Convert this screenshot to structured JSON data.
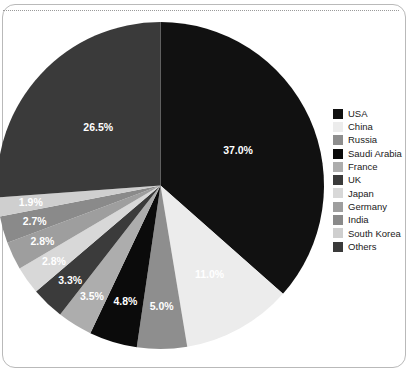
{
  "chart_data": {
    "type": "pie",
    "title": "",
    "subtitle": "",
    "legend_position": "right",
    "start_angle_deg": 0,
    "direction": "clockwise",
    "categories": [
      "USA",
      "China",
      "Russia",
      "Saudi Arabia",
      "France",
      "UK",
      "Japan",
      "Germany",
      "India",
      "South Korea",
      "Others"
    ],
    "values": [
      37.0,
      11.0,
      5.0,
      4.8,
      3.5,
      3.3,
      2.8,
      2.8,
      2.7,
      1.9,
      26.5
    ],
    "value_labels": [
      "37.0%",
      "11.0%",
      "5.0%",
      "4.8%",
      "3.5%",
      "3.3%",
      "2.8%",
      "2.8%",
      "2.7%",
      "1.9%",
      "26.5%"
    ],
    "colors": [
      "#111111",
      "#ececec",
      "#8e8e8e",
      "#0b0b0b",
      "#adadad",
      "#3b3b3b",
      "#d8d8d8",
      "#9e9e9e",
      "#8a8a8a",
      "#cfcfcf",
      "#3a3a3a"
    ],
    "label_text_colors": [
      "#ffffff",
      "#1a1a1a",
      "#ffffff",
      "#ffffff",
      "#ffffff",
      "#ffffff",
      "#1a1a1a",
      "#ffffff",
      "#ffffff",
      "#1a1a1a",
      "#ffffff"
    ],
    "xlabel": "",
    "ylabel": ""
  },
  "legend": {
    "items": [
      {
        "label": "USA",
        "color": "#111111"
      },
      {
        "label": "China",
        "color": "#ececec"
      },
      {
        "label": "Russia",
        "color": "#8e8e8e"
      },
      {
        "label": "Saudi Arabia",
        "color": "#0b0b0b"
      },
      {
        "label": "France",
        "color": "#adadad"
      },
      {
        "label": "UK",
        "color": "#3b3b3b"
      },
      {
        "label": "Japan",
        "color": "#d8d8d8"
      },
      {
        "label": "Germany",
        "color": "#9e9e9e"
      },
      {
        "label": "India",
        "color": "#8a8a8a"
      },
      {
        "label": "South Korea",
        "color": "#cfcfcf"
      },
      {
        "label": "Others",
        "color": "#3a3a3a"
      }
    ]
  }
}
